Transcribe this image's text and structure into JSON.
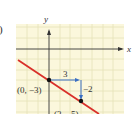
{
  "figure": {
    "part_label": ")",
    "axes": {
      "x_label": "x",
      "y_label": "y"
    },
    "points": [
      {
        "label": "(0, −3)",
        "x": 0,
        "y": -3
      },
      {
        "label": "(3, −5)",
        "x": 3,
        "y": -5
      }
    ],
    "run_label": "3",
    "rise_label": "−2",
    "colors": {
      "grid_bg": "#fbf7dc",
      "grid_line": "#e6e2b8",
      "axis": "#333333",
      "line": "#d9302a",
      "arrow": "#3b6fc4",
      "point": "#111111"
    }
  }
}
